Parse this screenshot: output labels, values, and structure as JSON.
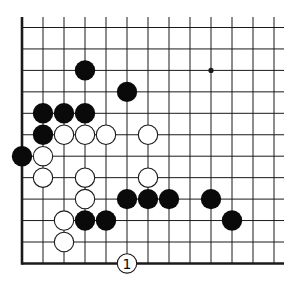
{
  "diagram": {
    "type": "go-board-fragment",
    "view": "lower-left corner region",
    "grid": {
      "columns": 13,
      "rows": 12,
      "left_edge": true,
      "bottom_edge": true,
      "x0": 22,
      "dx": 21.0,
      "y0": 27.5,
      "dy": 21.45,
      "extend_right": 284,
      "extend_top": 17
    },
    "star_points": [
      {
        "col": 9,
        "row": 2
      }
    ],
    "black_stones": [
      {
        "col": 3,
        "row": 2
      },
      {
        "col": 5,
        "row": 3
      },
      {
        "col": 1,
        "row": 4
      },
      {
        "col": 2,
        "row": 4
      },
      {
        "col": 3,
        "row": 4
      },
      {
        "col": 1,
        "row": 5
      },
      {
        "col": 0,
        "row": 6
      },
      {
        "col": 5,
        "row": 8
      },
      {
        "col": 6,
        "row": 8
      },
      {
        "col": 7,
        "row": 8
      },
      {
        "col": 9,
        "row": 8
      },
      {
        "col": 3,
        "row": 9
      },
      {
        "col": 4,
        "row": 9
      },
      {
        "col": 10,
        "row": 9
      }
    ],
    "white_stones": [
      {
        "col": 2,
        "row": 5
      },
      {
        "col": 3,
        "row": 5
      },
      {
        "col": 4,
        "row": 5
      },
      {
        "col": 6,
        "row": 5
      },
      {
        "col": 1,
        "row": 6
      },
      {
        "col": 1,
        "row": 7
      },
      {
        "col": 3,
        "row": 7
      },
      {
        "col": 6,
        "row": 7
      },
      {
        "col": 3,
        "row": 8
      },
      {
        "col": 2,
        "row": 9
      },
      {
        "col": 2,
        "row": 10
      }
    ],
    "numbered_moves": [
      {
        "col": 5,
        "row": 11,
        "color": "white",
        "label": "1"
      }
    ],
    "colors": {
      "line": "#1a1a1a",
      "black_stone": "#0a0a0a",
      "white_stone_fill": "#ffffff",
      "white_stone_stroke": "#1a1a1a",
      "background": "#ffffff"
    },
    "stone_radius": 10.2
  }
}
